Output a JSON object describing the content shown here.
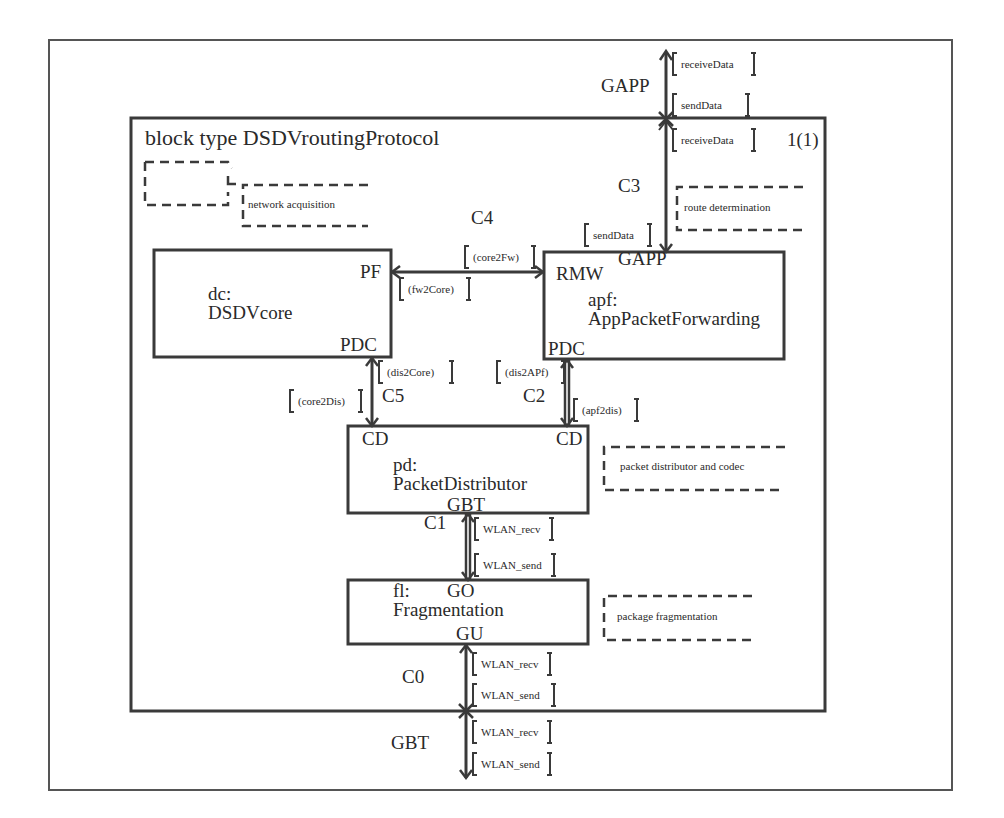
{
  "diagram": {
    "title": "block type DSDVroutingProtocol",
    "page": "1(1)",
    "comments": {
      "network": "network acquisition",
      "route": "route determination",
      "distributor": "packet distributor and codec",
      "fragmentation": "package fragmentation"
    },
    "blocks": {
      "dc": {
        "instance": "dc:",
        "type": "DSDVcore",
        "gate_pf": "PF",
        "gate_pdc": "PDC"
      },
      "apf": {
        "instance": "apf:",
        "type": "AppPacketForwarding",
        "gate_rmw": "RMW",
        "gate_gapp": "GAPP",
        "gate_pdc": "PDC"
      },
      "pd": {
        "instance": "pd:",
        "type": "PacketDistributor",
        "gate_cd_left": "CD",
        "gate_cd_right": "CD",
        "gate_gbt": "GBT"
      },
      "fl": {
        "instance": "fl:",
        "type": "Fragmentation",
        "gate_go": "GO",
        "gate_gu": "GU"
      }
    },
    "channels": {
      "c0": "C0",
      "c1": "C1",
      "c2": "C2",
      "c3": "C3",
      "c4": "C4",
      "c5": "C5"
    },
    "external_gates": {
      "gapp": "GAPP",
      "gbt": "GBT"
    },
    "signals": {
      "gapp_out_receive": "receiveData",
      "gapp_out_send": "sendData",
      "c3_receive": "receiveData",
      "c3_send": "sendData",
      "c4_core2fw": "(core2Fw)",
      "c4_fw2core": "(fw2Core)",
      "c5_dis2core": "(dis2Core)",
      "c5_core2dis": "(core2Dis)",
      "c2_dis2apf": "(dis2APf)",
      "c2_apf2dis": "(apf2dis)",
      "c1_recv": "WLAN_recv",
      "c1_send": "WLAN_send",
      "c0_recv": "WLAN_recv",
      "c0_send": "WLAN_send",
      "gbt_recv": "WLAN_recv",
      "gbt_send": "WLAN_send"
    }
  }
}
